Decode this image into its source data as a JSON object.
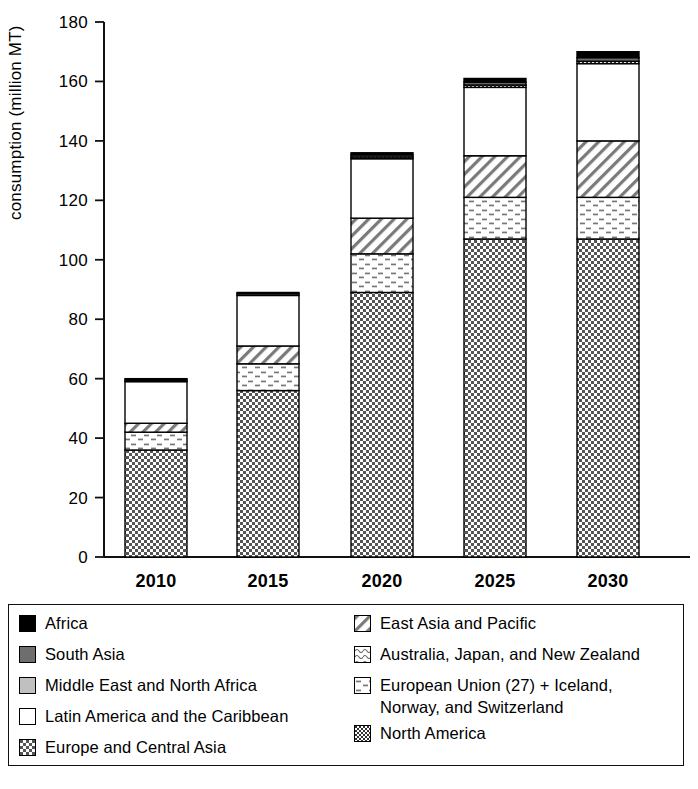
{
  "chart_data": {
    "type": "bar",
    "subtype": "stacked-bar",
    "title": "",
    "xlabel": "",
    "ylabel": "consumption (million MT)",
    "ylim": [
      0,
      180
    ],
    "yticks": [
      0,
      20,
      40,
      60,
      80,
      100,
      120,
      140,
      160,
      180
    ],
    "grid": false,
    "legend_position": "below",
    "categories": [
      "2010",
      "2015",
      "2020",
      "2025",
      "2030"
    ],
    "series": [
      {
        "name": "Europe and Central Asia",
        "pattern": "checker-dense",
        "values": [
          36,
          56,
          89,
          107,
          107
        ]
      },
      {
        "name": "European Union (27) + Iceland, Norway, and Switzerland",
        "pattern": "dots-sparse",
        "values": [
          6,
          9,
          13,
          14,
          14
        ]
      },
      {
        "name": "East Asia and Pacific",
        "pattern": "diagonal-hatch",
        "values": [
          3,
          6,
          12,
          14,
          19
        ]
      },
      {
        "name": "Latin America and the Caribbean",
        "pattern": "solid-white",
        "values": [
          14,
          17,
          20,
          23,
          26
        ]
      },
      {
        "name": "North America",
        "pattern": "checker-fine",
        "values": [
          0,
          0,
          0.6,
          0.8,
          0.8
        ]
      },
      {
        "name": "Middle East and North Africa",
        "pattern": "light-gray",
        "values": [
          0,
          0,
          0,
          0,
          0
        ]
      },
      {
        "name": "Australia, Japan, and New Zealand",
        "pattern": "wave-dots",
        "values": [
          0,
          0,
          0,
          0,
          0
        ]
      },
      {
        "name": "South Asia",
        "pattern": "mid-gray",
        "values": [
          0.5,
          0.6,
          0.7,
          0.9,
          1.2
        ]
      },
      {
        "name": "Africa",
        "pattern": "solid-black",
        "values": [
          0.5,
          0.4,
          0.7,
          1.3,
          2.0
        ]
      }
    ],
    "totals": [
      60,
      89,
      136,
      161,
      170
    ],
    "bar_tops": [
      60,
      89,
      136,
      161,
      170
    ]
  },
  "axis": {
    "y_title": "consumption (million MT)",
    "y_ticks": [
      "0",
      "20",
      "40",
      "60",
      "80",
      "100",
      "120",
      "140",
      "160",
      "180"
    ],
    "x_ticks": [
      "2010",
      "2015",
      "2020",
      "2025",
      "2030"
    ]
  },
  "legend": {
    "left_column": [
      {
        "label": "Africa",
        "swatch": "solid-black-swatch"
      },
      {
        "label": "South Asia",
        "swatch": "mid-gray-swatch"
      },
      {
        "label": "Middle East and North Africa",
        "swatch": "light-gray-swatch"
      },
      {
        "label": "Latin America and the Caribbean",
        "swatch": "white-swatch"
      },
      {
        "label": "Europe and Central Asia",
        "swatch": "checker-dense-swatch"
      }
    ],
    "right_column": [
      {
        "label": "East Asia and Pacific",
        "swatch": "diagonal-hatch-swatch"
      },
      {
        "label": "Australia, Japan, and New Zealand",
        "swatch": "wave-dots-swatch"
      },
      {
        "label": "European Union (27) + Iceland,\nNorway, and Switzerland",
        "swatch": "dots-sparse-swatch"
      },
      {
        "label": "North America",
        "swatch": "checker-fine-swatch"
      }
    ]
  },
  "colors": {
    "ink": "#000000",
    "background": "#ffffff",
    "mid_gray": "#6e6e6e",
    "light_gray": "#c0c0c0"
  }
}
